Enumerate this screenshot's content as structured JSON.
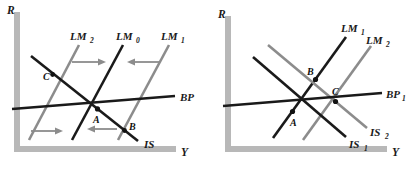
{
  "figure": {
    "background_color": "#ffffff",
    "dark_line_color": "#1a1a1a",
    "gray_line_color": "#8c8c8c",
    "axis_color": "#b8b8b8",
    "arrow_color": "#8c8c8c"
  },
  "panels": [
    {
      "id": "left",
      "axes": {
        "y_label": "R",
        "x_label": "Y"
      },
      "curves": [
        {
          "name": "LM2",
          "base": "LM",
          "subscript": "2",
          "label": "LM",
          "color": "gray"
        },
        {
          "name": "LM0",
          "base": "LM",
          "subscript": "0",
          "label": "LM",
          "color": "dark"
        },
        {
          "name": "LM1",
          "base": "LM",
          "subscript": "1",
          "label": "LM",
          "color": "gray"
        },
        {
          "name": "BP",
          "base": "BP",
          "subscript": "",
          "label": "BP",
          "color": "dark"
        },
        {
          "name": "IS",
          "base": "IS",
          "subscript": "",
          "label": "IS",
          "color": "dark"
        }
      ],
      "points": [
        {
          "name": "A",
          "label": "A"
        },
        {
          "name": "B",
          "label": "B"
        },
        {
          "name": "C",
          "label": "C"
        }
      ],
      "arrows": [
        {
          "name": "shift-right-upper",
          "direction": "right"
        },
        {
          "name": "shift-left-upper",
          "direction": "left"
        },
        {
          "name": "shift-right-lower",
          "direction": "right"
        },
        {
          "name": "shift-left-lower",
          "direction": "left"
        }
      ]
    },
    {
      "id": "right",
      "axes": {
        "y_label": "R",
        "x_label": "Y"
      },
      "curves": [
        {
          "name": "LM1",
          "base": "LM",
          "subscript": "1",
          "label": "LM",
          "color": "dark"
        },
        {
          "name": "LM2",
          "base": "LM",
          "subscript": "2",
          "label": "LM",
          "color": "gray"
        },
        {
          "name": "BP1",
          "base": "BP",
          "subscript": "1",
          "label": "BP",
          "color": "dark"
        },
        {
          "name": "IS2",
          "base": "IS",
          "subscript": "2",
          "label": "IS",
          "color": "gray"
        },
        {
          "name": "IS1",
          "base": "IS",
          "subscript": "1",
          "label": "IS",
          "color": "dark"
        }
      ],
      "points": [
        {
          "name": "A",
          "label": "A"
        },
        {
          "name": "B",
          "label": "B"
        },
        {
          "name": "C",
          "label": "C"
        }
      ],
      "arrows": []
    }
  ]
}
